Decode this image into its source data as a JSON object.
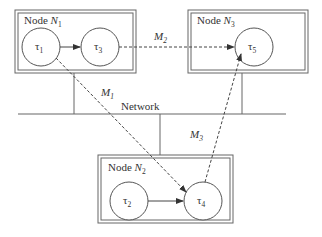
{
  "diagram": {
    "colors": {
      "stroke": "#555555",
      "text": "#333333",
      "background": "#ffffff"
    },
    "network": {
      "label": "Network"
    },
    "nodes": [
      {
        "id": "N1",
        "label": "Node",
        "name": "N",
        "sub": "1",
        "tasks": [
          {
            "name": "τ",
            "sub": "1"
          },
          {
            "name": "τ",
            "sub": "3"
          }
        ]
      },
      {
        "id": "N3",
        "label": "Node",
        "name": "N",
        "sub": "3",
        "tasks": [
          {
            "name": "τ",
            "sub": "5"
          }
        ]
      },
      {
        "id": "N2",
        "label": "Node",
        "name": "N",
        "sub": "2",
        "tasks": [
          {
            "name": "τ",
            "sub": "2"
          },
          {
            "name": "τ",
            "sub": "4"
          }
        ]
      }
    ],
    "messages": [
      {
        "name": "M",
        "sub": "1",
        "from": "τ1",
        "to": "τ4"
      },
      {
        "name": "M",
        "sub": "2",
        "from": "τ3",
        "to": "τ5"
      },
      {
        "name": "M",
        "sub": "3",
        "from": "τ4",
        "to": "τ5"
      }
    ],
    "local_edges": [
      {
        "from": "τ1",
        "to": "τ3"
      },
      {
        "from": "τ2",
        "to": "τ4"
      }
    ]
  }
}
